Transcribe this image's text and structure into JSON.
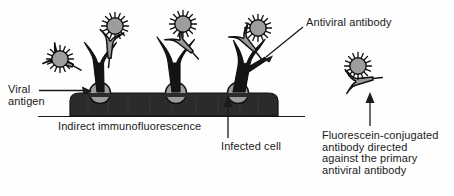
{
  "figure": {
    "title": "Indirect immunofluorescence",
    "labels": {
      "antiviral_antibody": "Antiviral antibody",
      "viral_antigen": "Viral\nantigen",
      "indirect_immunofluorescence": "Indirect immunofluorescence",
      "infected_cell": "Infected cell",
      "fluorescein_conjugated": "Fluorescein-conjugated\nantibody directed\nagainst the primary\nantiviral antibody"
    },
    "colors": {
      "ink": "#1a1a1a",
      "cell_fill": "#2b2b2b",
      "antigen_fill": "#9c9c9c",
      "secondary_antibody_fill": "#9a9a9a",
      "fluorescein_fill": "#9d9d9d",
      "background": "#fefefe"
    },
    "elements": {
      "cell_label": "infected cell membrane",
      "antigen_count": 3,
      "complex_count": 3,
      "free_antibody_label": "fluorescein-conjugated secondary antibody"
    }
  }
}
